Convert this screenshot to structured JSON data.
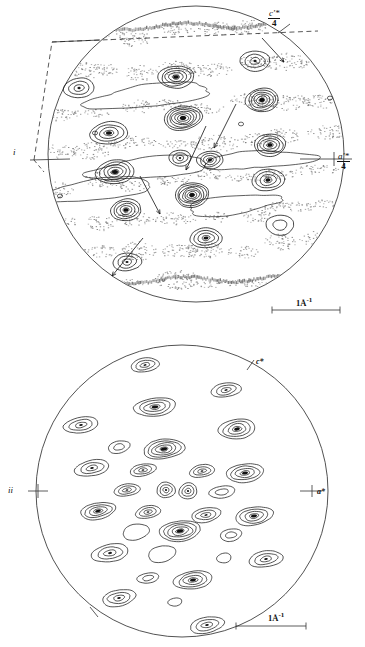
{
  "figure": {
    "type": "diffraction-contour-map"
  },
  "panels": [
    {
      "id": "i",
      "label": "i",
      "axis_labels": {
        "vertical": {
          "numerator": "c'*",
          "denominator": "4"
        },
        "horizontal": {
          "numerator": "a'*",
          "denominator": "4"
        }
      },
      "scale_bar": {
        "text": "1Å",
        "exponent": "-1",
        "full": "1Å⁻¹"
      },
      "has_diffuse_scattering": true,
      "has_dashed_cell_outline": true,
      "arrow_count": 5
    },
    {
      "id": "ii",
      "label": "ii",
      "axis_labels": {
        "c_star": "c*",
        "a_star": "a*"
      },
      "scale_bar": {
        "text": "1Å",
        "exponent": "-1",
        "full": "1Å⁻¹"
      },
      "has_diffuse_scattering": false,
      "has_dashed_cell_outline": false,
      "arrow_count": 0
    }
  ],
  "chart_data": {
    "type": "contour",
    "title": "",
    "xlabel": "a'*",
    "ylabel": "c'*",
    "panels": [
      {
        "id": "i",
        "circle": {
          "cx": 196,
          "cy": 154,
          "r": 148
        },
        "peaks": [
          {
            "x": 79,
            "y": 88,
            "rings": 3,
            "rx": 15,
            "ry": 10,
            "rot": -4,
            "dark": false
          },
          {
            "x": 176,
            "y": 77,
            "rings": 5,
            "rx": 18,
            "ry": 11,
            "rot": -4,
            "dark": false
          },
          {
            "x": 255,
            "y": 61,
            "rings": 3,
            "rx": 15,
            "ry": 10,
            "rot": -4,
            "dark": false
          },
          {
            "x": 262,
            "y": 100,
            "rings": 6,
            "rx": 16,
            "ry": 12,
            "rot": -4,
            "dark": false
          },
          {
            "x": 183,
            "y": 118,
            "rings": 7,
            "rx": 19,
            "ry": 12,
            "rot": -6,
            "dark": true
          },
          {
            "x": 109,
            "y": 133,
            "rings": 4,
            "rx": 19,
            "ry": 11,
            "rot": -4,
            "dark": false
          },
          {
            "x": 270,
            "y": 145,
            "rings": 5,
            "rx": 16,
            "ry": 11,
            "rot": -4,
            "dark": false
          },
          {
            "x": 210,
            "y": 160,
            "rings": 4,
            "rx": 13,
            "ry": 9,
            "rot": -4,
            "dark": false
          },
          {
            "x": 180,
            "y": 158,
            "rings": 3,
            "rx": 11,
            "ry": 8,
            "rot": -4,
            "dark": false
          },
          {
            "x": 115,
            "y": 172,
            "rings": 5,
            "rx": 19,
            "ry": 12,
            "rot": -4,
            "dark": false
          },
          {
            "x": 268,
            "y": 180,
            "rings": 4,
            "rx": 16,
            "ry": 11,
            "rot": -4,
            "dark": false
          },
          {
            "x": 192,
            "y": 195,
            "rings": 7,
            "rx": 17,
            "ry": 12,
            "rot": -5,
            "dark": true
          },
          {
            "x": 126,
            "y": 210,
            "rings": 5,
            "rx": 15,
            "ry": 11,
            "rot": -4,
            "dark": false
          },
          {
            "x": 280,
            "y": 225,
            "rings": 2,
            "rx": 14,
            "ry": 10,
            "rot": -4,
            "dark": false
          },
          {
            "x": 206,
            "y": 238,
            "rings": 4,
            "rx": 16,
            "ry": 10,
            "rot": -4,
            "dark": false
          },
          {
            "x": 127,
            "y": 262,
            "rings": 3,
            "rx": 14,
            "ry": 9,
            "rot": -4,
            "dark": false
          }
        ]
      },
      {
        "id": "ii",
        "circle": {
          "cx": 182,
          "cy": 161,
          "r": 146
        },
        "peaks": [
          {
            "x": 145,
            "y": 35,
            "rings": 3,
            "rx": 14,
            "ry": 7,
            "rot": -10
          },
          {
            "x": 226,
            "y": 60,
            "rings": 3,
            "rx": 15,
            "ry": 7,
            "rot": -10
          },
          {
            "x": 155,
            "y": 77,
            "rings": 4,
            "rx": 21,
            "ry": 9,
            "rot": -8
          },
          {
            "x": 237,
            "y": 99,
            "rings": 4,
            "rx": 18,
            "ry": 10,
            "rot": -8
          },
          {
            "x": 81,
            "y": 95,
            "rings": 3,
            "rx": 17,
            "ry": 8,
            "rot": -10
          },
          {
            "x": 164,
            "y": 119,
            "rings": 5,
            "rx": 20,
            "ry": 10,
            "rot": -8
          },
          {
            "x": 119,
            "y": 117,
            "rings": 2,
            "rx": 11,
            "ry": 6,
            "rot": -10
          },
          {
            "x": 92,
            "y": 138,
            "rings": 3,
            "rx": 17,
            "ry": 8,
            "rot": -10
          },
          {
            "x": 143,
            "y": 140,
            "rings": 3,
            "rx": 13,
            "ry": 6,
            "rot": -10
          },
          {
            "x": 202,
            "y": 141,
            "rings": 3,
            "rx": 13,
            "ry": 6,
            "rot": -10
          },
          {
            "x": 245,
            "y": 143,
            "rings": 4,
            "rx": 19,
            "ry": 9,
            "rot": -8
          },
          {
            "x": 127,
            "y": 160,
            "rings": 3,
            "rx": 13,
            "ry": 6,
            "rot": -10
          },
          {
            "x": 166,
            "y": 160,
            "rings": 3,
            "rx": 9,
            "ry": 8,
            "rot": -6
          },
          {
            "x": 188,
            "y": 161,
            "rings": 3,
            "rx": 9,
            "ry": 8,
            "rot": -6
          },
          {
            "x": 222,
            "y": 162,
            "rings": 2,
            "rx": 13,
            "ry": 6,
            "rot": -10
          },
          {
            "x": 98,
            "y": 181,
            "rings": 4,
            "rx": 18,
            "ry": 8,
            "rot": -10
          },
          {
            "x": 148,
            "y": 182,
            "rings": 3,
            "rx": 13,
            "ry": 6,
            "rot": -10
          },
          {
            "x": 206,
            "y": 185,
            "rings": 3,
            "rx": 15,
            "ry": 7,
            "rot": -10
          },
          {
            "x": 254,
            "y": 186,
            "rings": 4,
            "rx": 19,
            "ry": 9,
            "rot": -8
          },
          {
            "x": 180,
            "y": 201,
            "rings": 5,
            "rx": 21,
            "ry": 10,
            "rot": -8
          },
          {
            "x": 136,
            "y": 202,
            "rings": 1,
            "rx": 13,
            "ry": 8,
            "rot": -10
          },
          {
            "x": 231,
            "y": 205,
            "rings": 2,
            "rx": 11,
            "ry": 6,
            "rot": -10
          },
          {
            "x": 110,
            "y": 223,
            "rings": 3,
            "rx": 18,
            "ry": 9,
            "rot": -10
          },
          {
            "x": 162,
            "y": 224,
            "rings": 1,
            "rx": 14,
            "ry": 8,
            "rot": -10
          },
          {
            "x": 224,
            "y": 228,
            "rings": 1,
            "rx": 7,
            "ry": 5,
            "rot": -10
          },
          {
            "x": 266,
            "y": 229,
            "rings": 3,
            "rx": 17,
            "ry": 8,
            "rot": -10
          },
          {
            "x": 148,
            "y": 248,
            "rings": 2,
            "rx": 11,
            "ry": 5,
            "rot": -10
          },
          {
            "x": 193,
            "y": 250,
            "rings": 4,
            "rx": 19,
            "ry": 9,
            "rot": -8
          },
          {
            "x": 119,
            "y": 268,
            "rings": 3,
            "rx": 17,
            "ry": 8,
            "rot": -10
          },
          {
            "x": 175,
            "y": 272,
            "rings": 1,
            "rx": 7,
            "ry": 4,
            "rot": -10
          },
          {
            "x": 207,
            "y": 295,
            "rings": 3,
            "rx": 17,
            "ry": 8,
            "rot": -10
          }
        ]
      }
    ]
  }
}
